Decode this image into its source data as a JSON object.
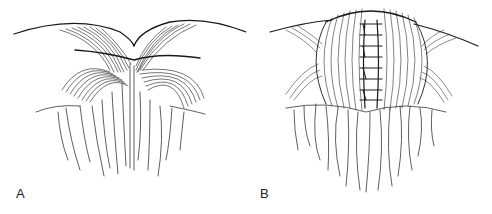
{
  "figure": {
    "panels": [
      {
        "id": "A",
        "label": "A",
        "description": "Two rounded tissue flaps meeting at a central point with fringed tissue below"
      },
      {
        "id": "B",
        "label": "B",
        "description": "Single dome of tissue closed with a vertical sutured seam, fringed tissue below"
      }
    ],
    "colors": {
      "line": "#1a1a1a",
      "background": "#ffffff"
    }
  }
}
